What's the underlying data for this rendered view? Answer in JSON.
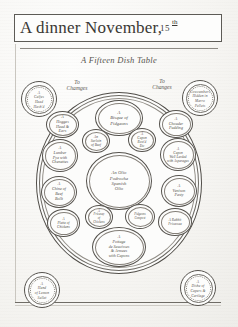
{
  "document": {
    "title": "A dinner November,",
    "title_day": "15",
    "title_ordinal": "th",
    "subtitle": "A Fifteen Dish Table"
  },
  "change_labels": [
    {
      "id": "left",
      "text": "To\nChamges"
    },
    {
      "id": "right",
      "text": "To\nChanges"
    }
  ],
  "corner_medallions": [
    {
      "id": "top-left",
      "text": "A\nCalfes\nHead\nHash'd"
    },
    {
      "id": "top-right",
      "text": "Cowcumbers\nHidden in\nMarro\nPellets"
    },
    {
      "id": "bottom-left",
      "text": "A\nHand\nof Lemon\nSallet"
    },
    {
      "id": "bottom-right",
      "text": "A\nDishe of\nCapers &\nCartlage"
    }
  ],
  "dishes": [
    {
      "id": "bisque",
      "name": "A Bisque of Pidgeons",
      "text": "A\nBisque of\nPidgeons"
    },
    {
      "id": "hogges",
      "name": "A Hogges Head & Ears",
      "text": "A\nHogges\nHead &\nEars"
    },
    {
      "id": "chouder",
      "name": "A Chouder Pudding",
      "text": "A\nChouder\nPudding"
    },
    {
      "id": "surloin",
      "name": "An Surloin of Beef",
      "text": "An\nSurloin\nof Beef"
    },
    {
      "id": "capon-rost",
      "name": "A Capon Rost'd",
      "text": "A\nCapon\nRost'd\nEtc"
    },
    {
      "id": "lumber",
      "name": "A Lumber Pye with Chenettes",
      "text": "A\nLumber\nPye with\nChenettes"
    },
    {
      "id": "capon-lard",
      "name": "A Capon Well Larded with Asparagus",
      "text": "A\nCapon\nWell Larded\nwith Asparagus"
    },
    {
      "id": "olio",
      "name": "An Olio Podrocha Spanish Olio",
      "text": "An Olio\nPodrocha\nSpanish\nOlio"
    },
    {
      "id": "chine",
      "name": "A Chine of Beef Bollt",
      "text": "A\nChine of\nBeef\nBollt"
    },
    {
      "id": "venison",
      "name": "A Venison Pasty",
      "text": "A\nVenison\nPasty"
    },
    {
      "id": "fricasey",
      "name": "A Fricasey of Chickens",
      "text": "A\nFricasey\nof\nChickens"
    },
    {
      "id": "pidgeon-comp",
      "name": "Pidgeons Compost",
      "text": "Pidgeons\nCompost"
    },
    {
      "id": "platte",
      "name": "A Platte of Chickens",
      "text": "A\nPlatte of\nChickens"
    },
    {
      "id": "rabbit",
      "name": "A Rabbit Fricassee",
      "text": "A Rabbit\nFricassee"
    },
    {
      "id": "pottage",
      "name": "A Pottage de Saucisses & Armees with Capons",
      "text": "A\nPottage\nde Saucisses\n& Armees\nwith Capons"
    }
  ],
  "colors": {
    "ink": "#4d4a45",
    "rule": "#5d5b56",
    "paper": "#fbfbfa"
  }
}
